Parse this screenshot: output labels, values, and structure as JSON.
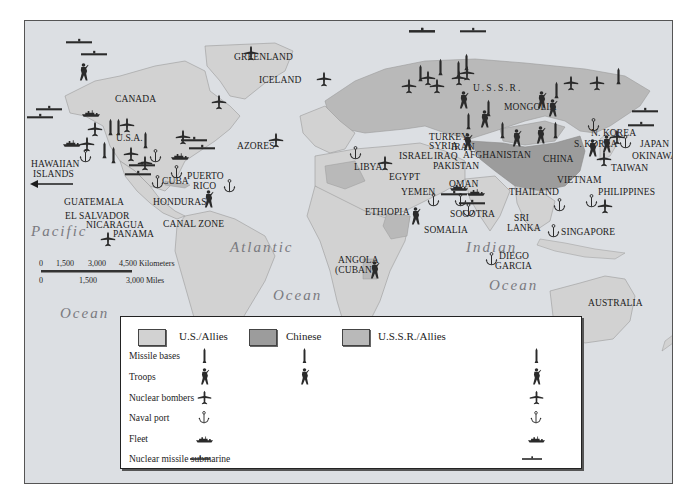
{
  "colors": {
    "ocean": "#dcdfe3",
    "us_allies": "#d2d2d2",
    "chinese": "#9c9c9c",
    "ussr_allies": "#b9b9b9",
    "symbol": "#2a2a2a"
  },
  "oceans": {
    "pacific_1": "Pacific",
    "pacific_2": "Ocean",
    "atlantic_1": "Atlantic",
    "atlantic_2": "Ocean",
    "indian_1": "Indian",
    "indian_2": "Ocean"
  },
  "places": {
    "greenland": "GREENLAND",
    "iceland": "ICELAND",
    "canada": "CANADA",
    "usa": "U.S.A.",
    "hawaiian_1": "HAWAIIAN",
    "hawaiian_2": "ISLANDS",
    "azores": "AZORES",
    "cuba": "CUBA",
    "puerto_rico_1": "PUERTO",
    "puerto_rico_2": "RICO",
    "guatemala": "GUATEMALA",
    "honduras": "HONDURAS",
    "el_salvador": "EL SALVADOR",
    "nicaragua": "NICARAGUA",
    "canal_zone": "CANAL ZONE",
    "panama": "PANAMA",
    "ussr": "U.S.S.R.",
    "mongolia": "MONGOLIA",
    "turkey": "TURKEY",
    "syria": "SYRIA",
    "iran": "IRAN",
    "israel": "ISRAEL",
    "iraq": "IRAQ",
    "libya": "LIBYA",
    "egypt": "EGYPT",
    "afghanistan": "AFGHANISTAN",
    "pakistan": "PAKISTAN",
    "oman": "OMAN",
    "yemen": "YEMEN",
    "ethiopia": "ETHIOPIA",
    "socotra": "SOCOTRA",
    "somalia": "SOMALIA",
    "china": "CHINA",
    "n_korea": "N. KOREA",
    "s_korea": "S. KOREA",
    "japan": "JAPAN",
    "okinawa": "OKINAWA",
    "taiwan": "TAIWAN",
    "vietnam": "VIETNAM",
    "thailand": "THAILAND",
    "philippines": "PHILIPPINES",
    "sri_lanka_1": "SRI",
    "sri_lanka_2": "LANKA",
    "singapore": "SINGAPORE",
    "diego_garcia_1": "DIEGO",
    "diego_garcia_2": "GARCIA",
    "angola_1": "ANGOLA",
    "angola_2": "(CUBAN)",
    "australia": "AUSTRALIA"
  },
  "scale": {
    "km_ticks": [
      "0",
      "1,500",
      "3,000",
      "4,500 Kilometers"
    ],
    "mi_ticks": [
      "0",
      "1,500",
      "3,000 Miles"
    ]
  },
  "legend": {
    "columns": [
      {
        "label": "U.S./Allies",
        "color": "#d2d2d2"
      },
      {
        "label": "Chinese",
        "color": "#9c9c9c"
      },
      {
        "label": "U.S.S.R./Allies",
        "color": "#b9b9b9"
      }
    ],
    "rows": [
      {
        "label": "Missile bases",
        "icon": "missile-icon",
        "us": true,
        "chinese": true,
        "ussr": true
      },
      {
        "label": "Troops",
        "icon": "soldier-icon",
        "us": true,
        "chinese": true,
        "ussr": true
      },
      {
        "label": "Nuclear bombers",
        "icon": "bomber-icon",
        "us": true,
        "chinese": false,
        "ussr": true
      },
      {
        "label": "Naval port",
        "icon": "anchor-icon",
        "us": true,
        "chinese": false,
        "ussr": true
      },
      {
        "label": "Fleet",
        "icon": "fleet-icon",
        "us": true,
        "chinese": false,
        "ussr": true
      },
      {
        "label": "Nuclear missile submarine",
        "icon": "submarine-icon",
        "us": true,
        "chinese": false,
        "ussr": true
      }
    ]
  }
}
